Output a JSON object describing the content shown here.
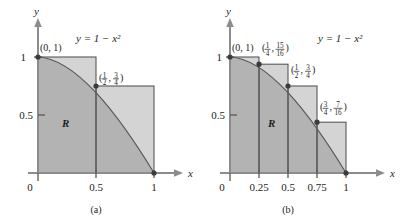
{
  "figure": {
    "curve_equation": "y = 1 − x²",
    "region_label": "R",
    "axis_x_name": "x",
    "axis_y_name": "y",
    "y_ticks": [
      "0.5",
      "1"
    ],
    "origin_label": "0"
  },
  "panel_a": {
    "caption": "(a)",
    "x_ticks": [
      "0",
      "0.5",
      "1"
    ],
    "equation": "y = 1 − x²",
    "region_label": "R",
    "points": [
      {
        "label": "(0, 1)",
        "x": 0,
        "y": 1
      },
      {
        "label": "(1/2, 3/4)",
        "num1": "1",
        "den1": "2",
        "num2": "3",
        "den2": "4",
        "x": 0.5,
        "y": 0.75
      }
    ],
    "rectangles": [
      {
        "x0": 0,
        "x1": 0.5,
        "height": 1
      },
      {
        "x0": 0.5,
        "x1": 1,
        "height": 0.75
      }
    ]
  },
  "panel_b": {
    "caption": "(b)",
    "x_ticks": [
      "0",
      "0.25",
      "0.5",
      "0.75",
      "1"
    ],
    "equation": "y = 1 − x²",
    "region_label": "R",
    "points": [
      {
        "label": "(0, 1)",
        "x": 0,
        "y": 1
      },
      {
        "label": "(1/4, 15/16)",
        "num1": "1",
        "den1": "4",
        "num2": "15",
        "den2": "16",
        "x": 0.25,
        "y": 0.9375
      },
      {
        "label": "(1/2, 3/4)",
        "num1": "1",
        "den1": "2",
        "num2": "3",
        "den2": "4",
        "x": 0.5,
        "y": 0.75
      },
      {
        "label": "(3/4, 7/16)",
        "num1": "3",
        "den1": "4",
        "num2": "7",
        "den2": "16",
        "x": 0.75,
        "y": 0.4375
      }
    ],
    "rectangles": [
      {
        "x0": 0,
        "x1": 0.25,
        "height": 1
      },
      {
        "x0": 0.25,
        "x1": 0.5,
        "height": 0.9375
      },
      {
        "x0": 0.5,
        "x1": 0.75,
        "height": 0.75
      },
      {
        "x0": 0.75,
        "x1": 1,
        "height": 0.4375
      }
    ]
  },
  "colors": {
    "region_fill": "#b3b3b3",
    "rect_fill": "#d4d4d4",
    "axis": "#8c8c8c",
    "outline": "#58585a",
    "text": "#231f20"
  }
}
